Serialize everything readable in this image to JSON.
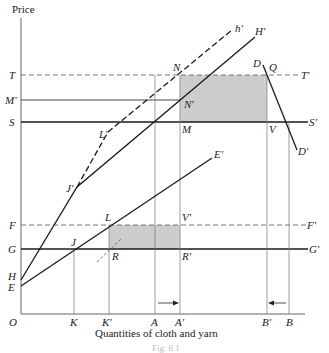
{
  "diagram": {
    "y_axis_title": "Price",
    "x_axis_title": "Quantities of cloth and yarn",
    "caption": "Fig. 6.1",
    "origin_label": "O",
    "y_labels": {
      "T": "T",
      "M_prime": "M'",
      "S": "S",
      "F": "F",
      "G": "G",
      "H": "H",
      "E": "E"
    },
    "x_labels": {
      "K": "K",
      "K_prime": "K'",
      "A": "A",
      "A_prime": "A'",
      "B_prime": "B'",
      "B": "B"
    },
    "line_end_labels": {
      "T_prime": "T'",
      "S_prime": "S'",
      "F_prime": "F'",
      "G_prime": "G'",
      "h_prime": "h'",
      "H_prime": "H'",
      "E_prime": "E'",
      "D": "D",
      "D_prime": "D'"
    },
    "point_labels": {
      "N": "N",
      "N_prime": "N'",
      "M": "M",
      "Q": "Q",
      "V": "V",
      "J_prime": "J'",
      "L_prime": "L'",
      "L": "L",
      "J": "J",
      "R": "R",
      "R_prime": "R'",
      "V_prime": "V'"
    },
    "colors": {
      "line": "#1a1a1a",
      "thin_line": "#777777",
      "shading": "#c8c8c8"
    },
    "shaded_regions": [
      {
        "name": "NQVM",
        "x1": 180,
        "y1": 75,
        "x2": 267,
        "y2": 122
      },
      {
        "name": "LV'R'R",
        "x1": 109,
        "y1": 225,
        "x2": 180,
        "y2": 249
      }
    ],
    "arrows": [
      {
        "from": "A",
        "to": "A'",
        "direction": "right"
      },
      {
        "from": "B",
        "to": "B'",
        "direction": "left"
      }
    ]
  }
}
